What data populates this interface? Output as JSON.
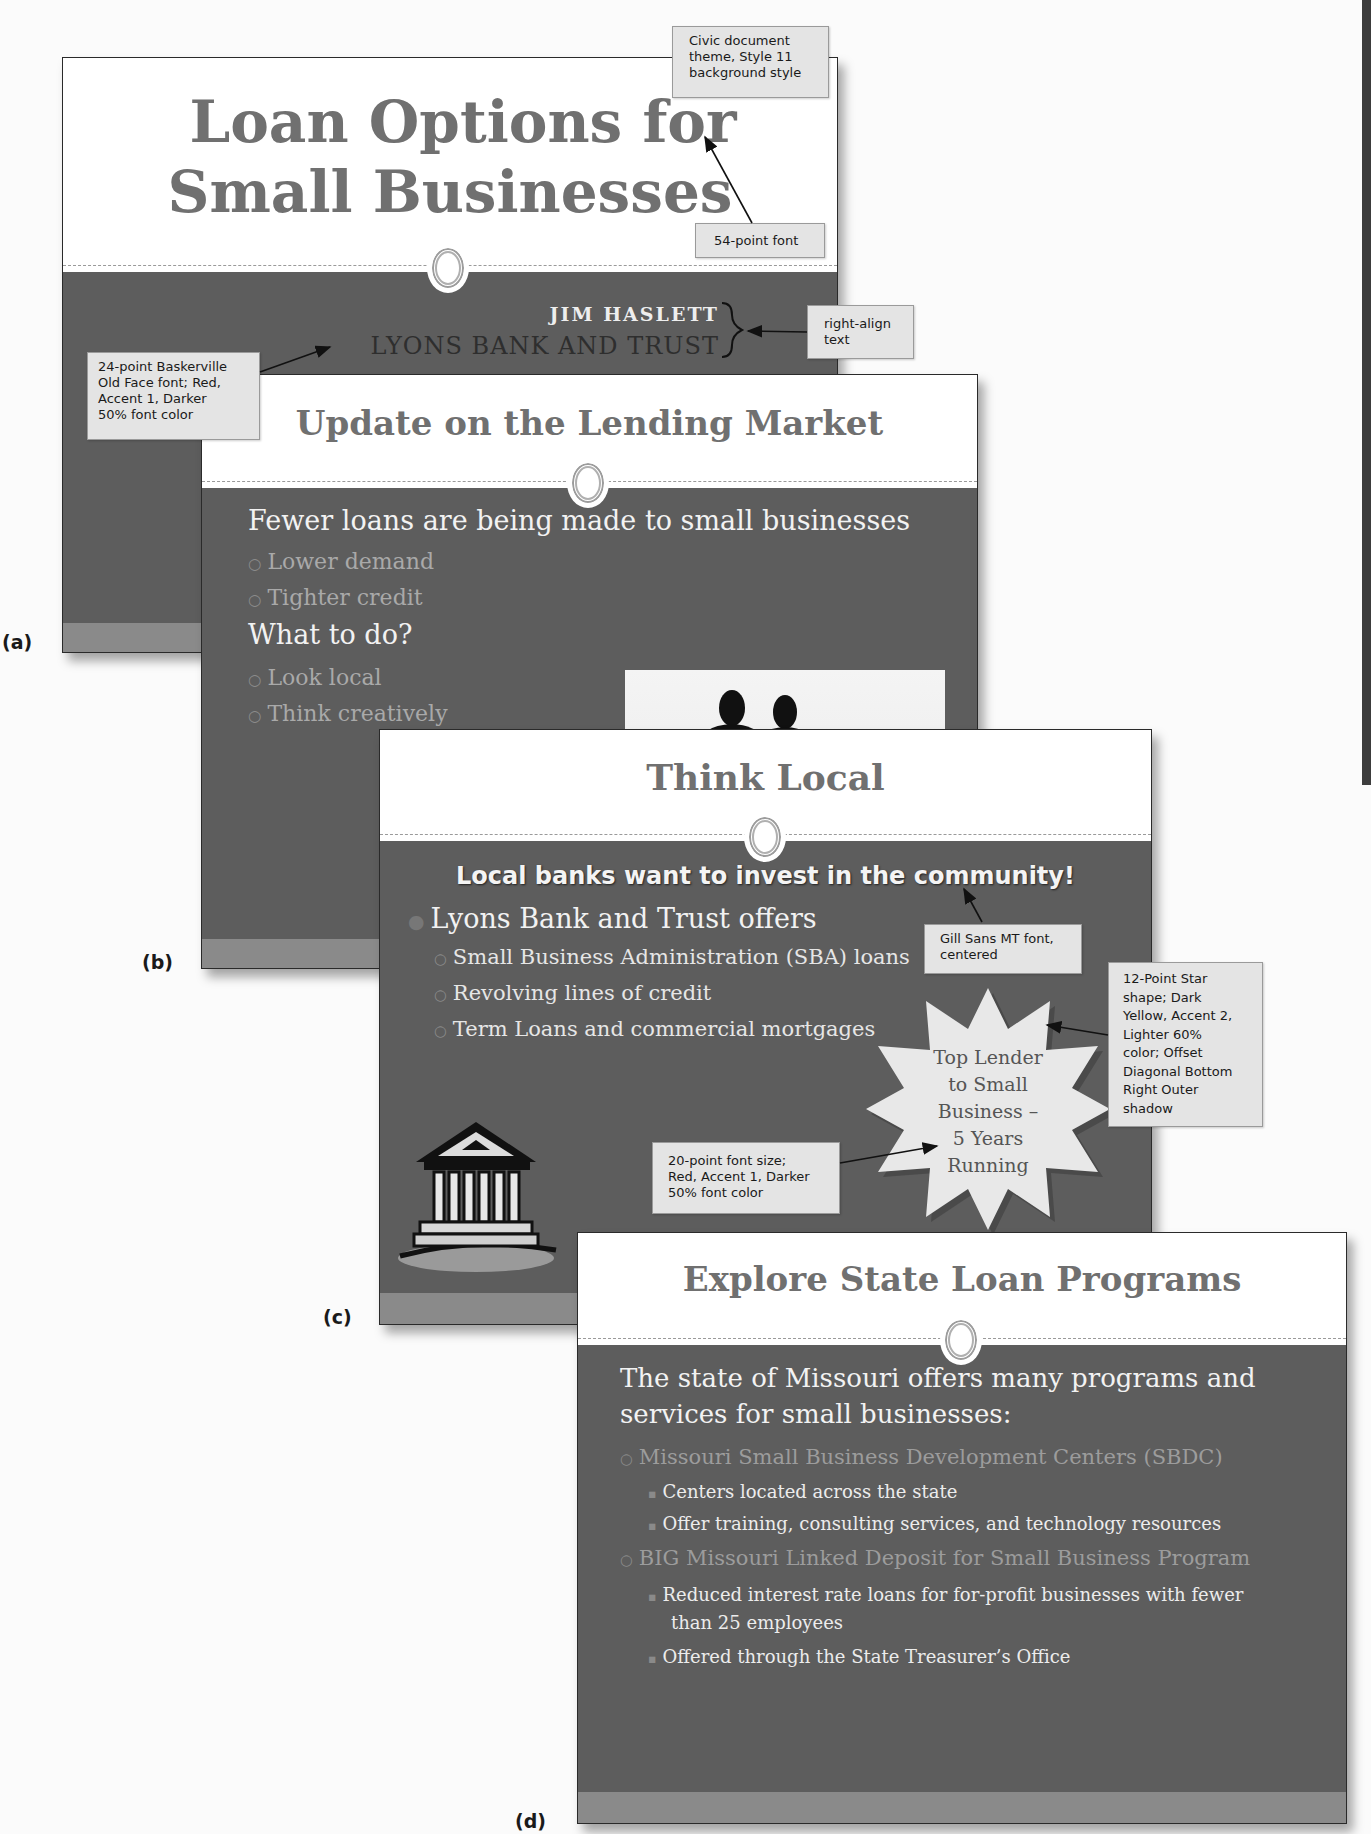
{
  "colors": {
    "slide_dark": "#5d5d5d",
    "slide_strip": "#8a8a8a",
    "title_gray": "#707070",
    "text_light": "#f2f2f2",
    "text_sub": "#a9a9a9",
    "callout_bg": "#e4e4e4",
    "star_fill": "#e8e8e8"
  },
  "slides": {
    "a": {
      "label": "(a)",
      "title_line1": "Loan Options for",
      "title_line2": "Small Businesses",
      "subtitle_name": "JIM HASLETT",
      "subtitle_company": "LYONS BANK AND TRUST"
    },
    "b": {
      "label": "(b)",
      "title": "Update on the Lending Market",
      "bullets": [
        {
          "text": "Fewer loans are being made to small businesses",
          "level": 1
        },
        {
          "text": "Lower demand",
          "level": 2
        },
        {
          "text": "Tighter credit",
          "level": 2
        },
        {
          "text": "What to do?",
          "level": 1
        },
        {
          "text": "Look local",
          "level": 2
        },
        {
          "text": "Think creatively",
          "level": 2
        }
      ],
      "image": "business-people-silhouette"
    },
    "c": {
      "label": "(c)",
      "title": "Think Local",
      "headline": "Local banks want to invest in the community!",
      "bullets": [
        {
          "text": "Lyons Bank and Trust offers",
          "level": 1
        },
        {
          "text": "Small Business Administration (SBA) loans",
          "level": 2
        },
        {
          "text": "Revolving lines of credit",
          "level": 2
        },
        {
          "text": "Term Loans and commercial mortgages",
          "level": 2
        }
      ],
      "star_lines": [
        "Top Lender",
        "to Small",
        "Business –",
        "5 Years",
        "Running"
      ],
      "clipart": "bank-building"
    },
    "d": {
      "label": "(d)",
      "title": "Explore State Loan Programs",
      "intro_line1": "The state of Missouri offers many programs and",
      "intro_line2": "services for small businesses:",
      "bullets": [
        {
          "text": "Missouri Small Business Development Centers (SBDC)",
          "level": 2
        },
        {
          "text": "Centers located across the state",
          "level": 3
        },
        {
          "text": "Offer training, consulting services, and technology resources",
          "level": 3
        },
        {
          "text": "BIG Missouri Linked Deposit for Small Business Program",
          "level": 2
        },
        {
          "text": "Reduced interest rate loans for for-profit businesses with fewer",
          "level": 3
        },
        {
          "text": "than 25 employees",
          "level": 3
        },
        {
          "text": "Offered through the State Treasurer’s Office",
          "level": 3
        }
      ]
    }
  },
  "callouts": {
    "theme": [
      "Civic document",
      "theme, Style 11",
      "background style"
    ],
    "font54": [
      "54-point font"
    ],
    "right_align": [
      "right-align",
      "text"
    ],
    "baskerville": [
      "24-point Baskerville",
      "Old Face font; Red,",
      "Accent 1, Darker",
      "50% font color"
    ],
    "gill_sans": [
      "Gill Sans MT font,",
      "centered"
    ],
    "star_shape": [
      "12-Point Star",
      "shape;  Dark",
      "Yellow, Accent 2,",
      "Lighter 60%",
      "color; Offset",
      "Diagonal Bottom",
      "Right Outer",
      "shadow"
    ],
    "font20": [
      "20-point font size;",
      "Red, Accent 1, Darker",
      "50% font color"
    ]
  }
}
